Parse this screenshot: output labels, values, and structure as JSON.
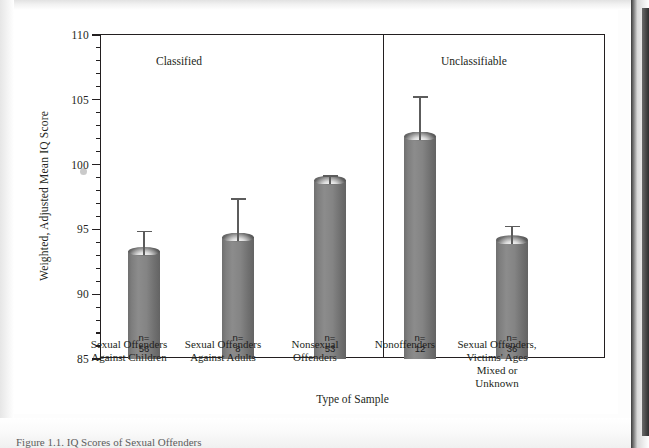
{
  "figure": {
    "caption": "Figure 1.1.  IQ Scores  of  Sexual Offenders"
  },
  "chart_data": {
    "type": "bar",
    "title": "",
    "xlabel": "Type of Sample",
    "ylabel": "Weighted, Adjusted Mean IQ Score",
    "ylim": [
      85,
      110
    ],
    "ytick_step_major": 5,
    "ytick_step_minor": 1,
    "ytick_labels": [
      "85",
      "90",
      "95",
      "100",
      "105",
      "110"
    ],
    "ytick_values": [
      85,
      90,
      95,
      100,
      105,
      110
    ],
    "grid": false,
    "legend": "none",
    "panels": [
      {
        "label": "Classified",
        "categories": [
          0,
          1,
          2
        ]
      },
      {
        "label": "Unclassifiable",
        "categories": [
          3,
          4
        ]
      }
    ],
    "categories": [
      "Sexual Offenders\nAgainst Children",
      "Sexual Offenders\nAgainst Adults",
      "Nonsexual\nOffenders",
      "Nonoffenders",
      "Sexual Offenders,\nVictims' Ages\nMixed or\nUnknown"
    ],
    "values": [
      93.3,
      94.4,
      98.8,
      102.2,
      94.2
    ],
    "error_upper": [
      94.9,
      97.4,
      99.2,
      105.3,
      95.3
    ],
    "sample_sizes": [
      56,
      8,
      53,
      12,
      36
    ],
    "n_prefix": "n=",
    "bar_color": "#808080",
    "axis_color": "#231f20"
  }
}
